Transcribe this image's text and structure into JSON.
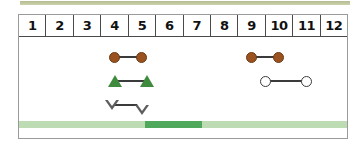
{
  "chart_data": {
    "type": "scatter",
    "title": "",
    "xlabel": "",
    "ylabel": "",
    "xlim": [
      0.5,
      12.5
    ],
    "grid": true,
    "legend": "none",
    "categories": [
      "1",
      "2",
      "3",
      "4",
      "5",
      "6",
      "7",
      "8",
      "9",
      "10",
      "11",
      "12"
    ],
    "series": [
      {
        "name": "brown-filled-circle-range-left",
        "marker": "filled-circle",
        "color": "#9a5320",
        "row": 1,
        "start": 4.0,
        "end": 5.0
      },
      {
        "name": "brown-filled-circle-range-right",
        "marker": "filled-circle",
        "color": "#9a5320",
        "row": 1,
        "start": 9.0,
        "end": 10.0
      },
      {
        "name": "green-filled-triangle-range",
        "marker": "filled-triangle-up",
        "color": "#3e8b3e",
        "row": 2,
        "start": 4.0,
        "end": 5.2
      },
      {
        "name": "open-circle-range",
        "marker": "open-circle",
        "color": "#3b3b3b",
        "row": 2,
        "start": 9.5,
        "end": 11.0
      },
      {
        "name": "open-triangle-down-range",
        "marker": "open-triangle-down",
        "color": "#5d5d5d",
        "row": 3,
        "start": 3.9,
        "end": 5.0
      }
    ],
    "bars": [
      {
        "name": "top-strip",
        "color": "#b5bb92"
      },
      {
        "name": "bottom-track",
        "color": "#bedcb4",
        "highlight_color": "#4fa85c",
        "highlight_start": 5.1,
        "highlight_end": 7.2
      }
    ]
  },
  "header": {
    "columns": [
      {
        "label": "1"
      },
      {
        "label": "2"
      },
      {
        "label": "3"
      },
      {
        "label": "4"
      },
      {
        "label": "5"
      },
      {
        "label": "6"
      },
      {
        "label": "7"
      },
      {
        "label": "8"
      },
      {
        "label": "9"
      },
      {
        "label": "10"
      },
      {
        "label": "11"
      },
      {
        "label": "12"
      }
    ]
  },
  "colors": {
    "brown": "#9a5320",
    "green": "#3e8b3e",
    "light_green": "#bedcb4",
    "dark_green": "#4fa85c",
    "olive": "#b5bb92",
    "line": "#3b3b3b",
    "border": "#9a9a9a"
  }
}
